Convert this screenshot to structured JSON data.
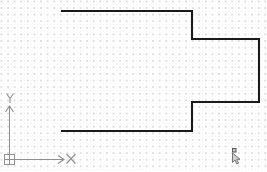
{
  "application": {
    "name": "cad-drawing-canvas",
    "background_color": "#ffffff"
  },
  "canvas": {
    "width": 267,
    "height": 172,
    "grid": {
      "visible": true,
      "style": "dot",
      "major_spacing_px": 6.6,
      "minor_spacing_px": 3.3,
      "major_color": "#dedede",
      "minor_color": "#e9e9e9"
    }
  },
  "ucs_icon": {
    "name": "ucs-world-coordinate-icon",
    "origin_x": 9.5,
    "origin_y": 159.5,
    "color": "#8f8f8f",
    "x_axis_label": "X",
    "y_axis_label": "Y",
    "x_axis_length": 55,
    "y_axis_length": 55
  },
  "cursor": {
    "name": "pickbox-crosshair-cursor",
    "x": 234,
    "y": 152,
    "color": "#6b6b6b"
  },
  "geometry": {
    "name": "step-polyline",
    "color": "#1a1a1a",
    "stroke_width": 2.1,
    "closed": false,
    "points": [
      [
        62,
        11
      ],
      [
        192,
        11
      ],
      [
        192,
        39
      ],
      [
        259,
        39
      ],
      [
        259,
        102
      ],
      [
        192,
        102
      ],
      [
        192,
        131
      ],
      [
        62,
        131
      ]
    ],
    "segments": [
      {
        "label": "top-horizontal",
        "from": [
          62,
          11
        ],
        "to": [
          192,
          11
        ]
      },
      {
        "label": "upper-right-vertical",
        "from": [
          192,
          11
        ],
        "to": [
          192,
          39
        ]
      },
      {
        "label": "upper-step-horizontal",
        "from": [
          192,
          39
        ],
        "to": [
          259,
          39
        ]
      },
      {
        "label": "far-right-vertical",
        "from": [
          259,
          39
        ],
        "to": [
          259,
          102
        ]
      },
      {
        "label": "lower-step-horizontal",
        "from": [
          259,
          102
        ],
        "to": [
          192,
          102
        ]
      },
      {
        "label": "lower-right-vertical",
        "from": [
          192,
          102
        ],
        "to": [
          192,
          131
        ]
      },
      {
        "label": "bottom-horizontal",
        "from": [
          192,
          131
        ],
        "to": [
          62,
          131
        ]
      }
    ]
  }
}
